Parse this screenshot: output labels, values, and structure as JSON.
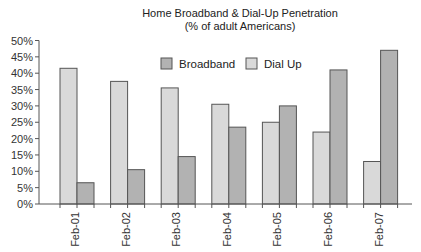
{
  "chart_data": {
    "type": "bar",
    "title": "Home Broadband & Dial-Up Penetration",
    "subtitle": "(% of adult Americans)",
    "xlabel": "",
    "ylabel": "",
    "categories": [
      "Feb-01",
      "Feb-02",
      "Feb-03",
      "Feb-04",
      "Feb-05",
      "Feb-06",
      "Feb-07"
    ],
    "series": [
      {
        "name": "Dial Up",
        "color": "#d9d9d9",
        "values": [
          41.5,
          37.5,
          35.5,
          30.5,
          25,
          22,
          13
        ]
      },
      {
        "name": "Broadband",
        "color": "#b2b2b2",
        "values": [
          6.5,
          10.5,
          14.5,
          23.5,
          30,
          41,
          47
        ]
      }
    ],
    "ylim": [
      0,
      50
    ],
    "yticks": [
      "0%",
      "5%",
      "10%",
      "15%",
      "20%",
      "25%",
      "30%",
      "35%",
      "40%",
      "45%",
      "50%"
    ],
    "ytick_values": [
      0,
      5,
      10,
      15,
      20,
      25,
      30,
      35,
      40,
      45,
      50
    ],
    "grid": false,
    "legend": {
      "position": "top-center-inside",
      "items": [
        {
          "label": "Broadband",
          "color": "#b2b2b2"
        },
        {
          "label": "Dial Up",
          "color": "#d9d9d9"
        }
      ]
    },
    "bar_border_color": "#555555",
    "axis_color": "#555555"
  }
}
